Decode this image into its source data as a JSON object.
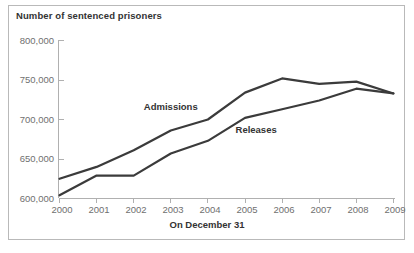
{
  "chart_data": {
    "type": "line",
    "title": "Number of sentenced prisoners",
    "xlabel": "On December 31",
    "ylabel": "",
    "x": [
      2000,
      2001,
      2002,
      2003,
      2004,
      2005,
      2006,
      2007,
      2008,
      2009
    ],
    "categories": [
      "2000",
      "2001",
      "2002",
      "2003",
      "2004",
      "2005",
      "2006",
      "2007",
      "2008",
      "2009"
    ],
    "series": [
      {
        "name": "Admissions",
        "values": [
          625000,
          640000,
          661000,
          686000,
          700000,
          734000,
          752000,
          745000,
          748000,
          733000
        ],
        "color": "#3b3b3b"
      },
      {
        "name": "Releases",
        "values": [
          604000,
          629000,
          629000,
          657000,
          673000,
          702000,
          713000,
          724000,
          739000,
          733000
        ],
        "color": "#3b3b3b"
      }
    ],
    "ylim": [
      600000,
      800000
    ],
    "yticks": [
      600000,
      650000,
      700000,
      750000,
      800000
    ],
    "ytick_labels": [
      "600,000",
      "650,000",
      "700,000",
      "750,000",
      "800,000"
    ],
    "xlim": [
      2000,
      2009
    ],
    "grid": false,
    "legend_position": "inline-annotations",
    "annotations": [
      {
        "text": "Admissions",
        "x": 2003,
        "y": 712000
      },
      {
        "text": "Releases",
        "x": 2005.3,
        "y": 683000
      }
    ]
  },
  "axis": {
    "y_tick_labels": [
      "800,000",
      "750,000",
      "700,000",
      "650,000",
      "600,000"
    ],
    "x_tick_labels": [
      "2000",
      "2001",
      "2002",
      "2003",
      "2004",
      "2005",
      "2006",
      "2007",
      "2008",
      "2009"
    ]
  },
  "labels": {
    "title": "Number of sentenced prisoners",
    "xaxis_title": "On December 31",
    "series_admissions": "Admissions",
    "series_releases": "Releases"
  }
}
